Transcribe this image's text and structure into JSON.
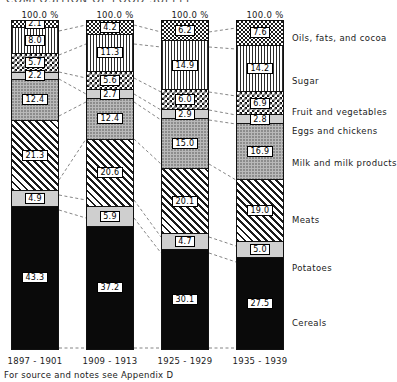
{
  "title_sliver": "COMPOSITION OF FOOD SUPPLY",
  "footnote": "For source and notes see Appendix D",
  "pct_headers": [
    "100.0 %",
    "100.0 %",
    "100.0 %",
    "100.0 %"
  ],
  "category_labels": [
    "Oils, fats, and cocoa",
    "Sugar",
    "Fruit and vegetables",
    "Eggs and chickens",
    "Milk and milk products",
    "Meats",
    "Potatoes",
    "Cereals"
  ],
  "period_labels": [
    "1897 - 1901",
    "1909 - 1913",
    "1925 - 1929",
    "1935 - 1939"
  ],
  "chart_data": {
    "type": "bar",
    "subtype": "stacked-percentage",
    "title": "COMPOSITION OF FOOD SUPPLY",
    "xlabel": "",
    "ylabel": "",
    "ylim": [
      0,
      100
    ],
    "grid": false,
    "legend_position": "right-labels",
    "categories": [
      "1897 - 1901",
      "1909 - 1913",
      "1925 - 1929",
      "1935 - 1939"
    ],
    "series": [
      {
        "name": "Oils, fats, and cocoa",
        "pattern": "stipple",
        "values": [
          2.1,
          4.2,
          6.2,
          7.6
        ]
      },
      {
        "name": "Sugar",
        "pattern": "vertical-lines",
        "values": [
          8.0,
          11.3,
          14.9,
          14.2
        ]
      },
      {
        "name": "Fruit and vegetables",
        "pattern": "checkerboard",
        "values": [
          5.7,
          5.6,
          6.0,
          6.9
        ]
      },
      {
        "name": "Eggs and chickens",
        "pattern": "light-gray",
        "values": [
          2.2,
          2.7,
          2.9,
          2.8
        ]
      },
      {
        "name": "Milk and milk products",
        "pattern": "gray-stipple",
        "values": [
          12.4,
          12.4,
          15.0,
          16.9
        ]
      },
      {
        "name": "Meats",
        "pattern": "diagonal-hatch",
        "values": [
          21.3,
          20.6,
          20.1,
          19.0
        ]
      },
      {
        "name": "Potatoes",
        "pattern": "light-gray",
        "values": [
          4.9,
          5.9,
          4.7,
          5.0
        ]
      },
      {
        "name": "Cereals",
        "pattern": "solid-black",
        "values": [
          43.3,
          37.2,
          30.1,
          27.5
        ]
      }
    ],
    "column_totals": [
      "100.0 %",
      "100.0 %",
      "100.0 %",
      "100.0 %"
    ]
  }
}
